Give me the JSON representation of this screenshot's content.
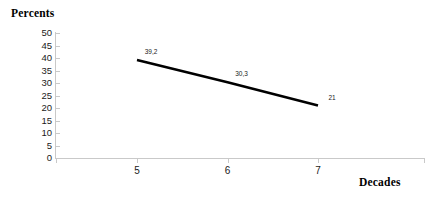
{
  "chart_data": {
    "type": "line",
    "title": "",
    "xlabel": "Decades",
    "ylabel": "Percents",
    "categories": [
      "5",
      "6",
      "7"
    ],
    "values": [
      39.2,
      30.3,
      21
    ],
    "point_labels": [
      "39,2",
      "30,3",
      "21"
    ],
    "series": [
      {
        "name": "Percents",
        "values": [
          39.2,
          30.3,
          21
        ],
        "color": "#000000"
      }
    ],
    "ylim": [
      0,
      50
    ],
    "y_ticks": [
      "50",
      "45",
      "40",
      "35",
      "30",
      "25",
      "20",
      "15",
      "10",
      "5",
      "0"
    ],
    "y_tick_values": [
      50,
      45,
      40,
      35,
      30,
      25,
      20,
      15,
      10,
      5,
      0
    ],
    "x_ticks": [
      "5",
      "6",
      "7"
    ],
    "grid": false,
    "legend": "none",
    "axis_color": "#c9c9c9",
    "line_color": "#000000"
  },
  "labels": {
    "y_axis_title": "Percents",
    "x_axis_title": "Decades"
  }
}
